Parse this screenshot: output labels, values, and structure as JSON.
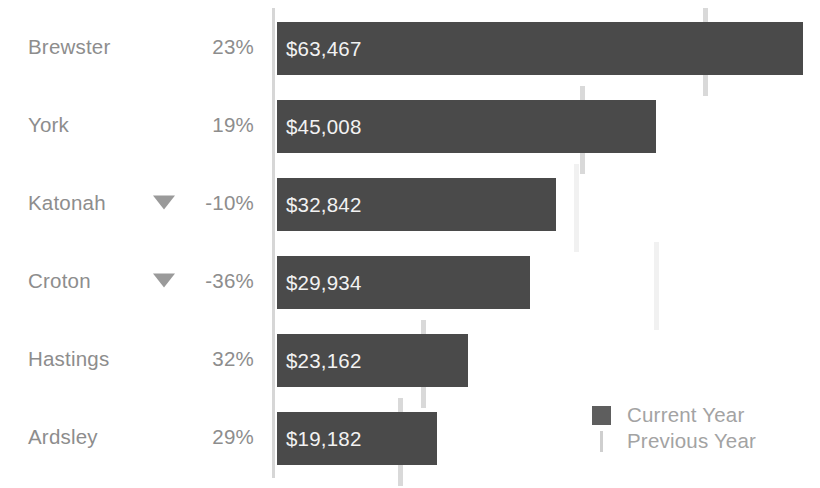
{
  "chart_data": {
    "type": "bar",
    "title": "",
    "subtitle": "",
    "xlabel": "",
    "ylabel": "",
    "orientation": "horizontal",
    "grid": false,
    "legend_position": "bottom-right",
    "xlim": [
      0,
      72000
    ],
    "categories": [
      "Brewster",
      "York",
      "Katonah",
      "Croton",
      "Hastings",
      "Ardsley"
    ],
    "series": [
      {
        "name": "Current Year",
        "color": "#4a4a4a",
        "values": [
          63467,
          45008,
          32842,
          29934,
          23162,
          19182
        ],
        "value_labels": [
          "$63,467",
          "$45,008",
          "$32,842",
          "$29,934",
          "$23,162",
          "$19,182"
        ]
      },
      {
        "name": "Previous Year",
        "color": "#d9d9d9",
        "marker_style": "reference-line",
        "values": [
          51599,
          37822,
          36491,
          46772,
          17547,
          14870
        ]
      }
    ],
    "delta_labels": [
      "23%",
      "19%",
      "-10%",
      "-36%",
      "32%",
      "29%"
    ],
    "delta_negative": [
      false,
      false,
      true,
      true,
      false,
      false
    ],
    "negative_indicator_icon": "triangle-down-icon"
  },
  "rows": [
    {
      "label": "Brewster",
      "delta": "23%",
      "negative": false,
      "value_label": "$63,467",
      "bar_width_px": 526,
      "marker_left_px": 426,
      "marker_top_px": 8,
      "marker_height_px": 88,
      "marker_faint": false
    },
    {
      "label": "York",
      "delta": "19%",
      "negative": false,
      "value_label": "$45,008",
      "bar_width_px": 379,
      "marker_left_px": 303,
      "marker_top_px": 86,
      "marker_height_px": 88,
      "marker_faint": false
    },
    {
      "label": "Katonah",
      "delta": "-10%",
      "negative": true,
      "value_label": "$32,842",
      "bar_width_px": 279,
      "marker_left_px": 297,
      "marker_top_px": 164,
      "marker_height_px": 88,
      "marker_faint": true
    },
    {
      "label": "Croton",
      "delta": "-36%",
      "negative": true,
      "value_label": "$29,934",
      "bar_width_px": 253,
      "marker_left_px": 377,
      "marker_top_px": 242,
      "marker_height_px": 88,
      "marker_faint": true
    },
    {
      "label": "Hastings",
      "delta": "32%",
      "negative": false,
      "value_label": "$23,162",
      "bar_width_px": 191,
      "marker_left_px": 144,
      "marker_top_px": 320,
      "marker_height_px": 88,
      "marker_faint": false
    },
    {
      "label": "Ardsley",
      "delta": "29%",
      "negative": false,
      "value_label": "$19,182",
      "bar_width_px": 160,
      "marker_left_px": 121,
      "marker_top_px": 398,
      "marker_height_px": 88,
      "marker_faint": false
    }
  ],
  "legend": {
    "current": {
      "label": "Current Year",
      "swatch": "filled-square",
      "color": "#5e5e5e"
    },
    "previous": {
      "label": "Previous Year",
      "swatch": "vertical-line",
      "color": "#cfcfcf"
    }
  },
  "colors": {
    "bar": "#4a4a4a",
    "bar_value_text": "#f2f2f2",
    "label_text": "#8d8d8d",
    "legend_text": "#a3a3a3",
    "axis": "#d6d6d6",
    "marker": "#d9d9d9",
    "marker_faint": "#f1f1f1",
    "background": "#ffffff"
  }
}
